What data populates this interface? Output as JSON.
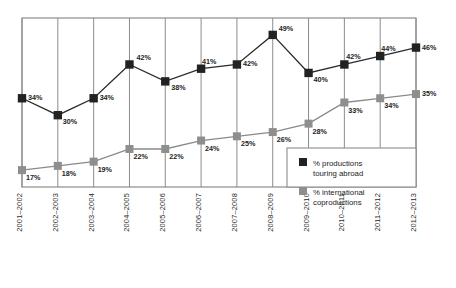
{
  "chart_data": {
    "type": "line",
    "title": "",
    "subtitle": "",
    "xlabel": "",
    "ylabel": "",
    "grid": "vertical",
    "legend_position": "bottom-right",
    "ylim": [
      13,
      53
    ],
    "categories": [
      "2001–2002",
      "2002–2003",
      "2003–2004",
      "2004–2005",
      "2005–2006",
      "2006–2007",
      "2007–2008",
      "2008–2009",
      "2009–2010",
      "2010–2011",
      "2011–2012",
      "2012–2013"
    ],
    "series": [
      {
        "name": "% productions touring abroad",
        "color": "#222222",
        "values": [
          34,
          30,
          34,
          42,
          38,
          41,
          42,
          49,
          40,
          42,
          44,
          46
        ],
        "labels": [
          "34%",
          "30%",
          "34%",
          "42%",
          "38%",
          "41%",
          "42%",
          "49%",
          "40%",
          "42%",
          "44%",
          "46%"
        ]
      },
      {
        "name": "% international coproductions",
        "color": "#8e8e8e",
        "values": [
          17,
          18,
          19,
          22,
          22,
          24,
          25,
          26,
          28,
          33,
          34,
          35
        ],
        "labels": [
          "17%",
          "18%",
          "19%",
          "22%",
          "22%",
          "24%",
          "25%",
          "26%",
          "28%",
          "33%",
          "34%",
          "35%"
        ]
      }
    ]
  },
  "legend": {
    "entries": [
      {
        "label_line1": "% productions",
        "label_line2": "touring abroad",
        "swatch_color": "#222222"
      },
      {
        "label_line1": "% international",
        "label_line2": "coproductions",
        "swatch_color": "#8e8e8e"
      }
    ]
  }
}
